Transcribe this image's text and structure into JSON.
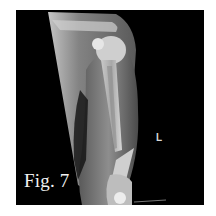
{
  "figure": {
    "caption": "Fig. 7",
    "side_marker": "L"
  },
  "colors": {
    "background": "#ffffff",
    "panel": "#000000",
    "caption_text": "#f2f2f2"
  }
}
